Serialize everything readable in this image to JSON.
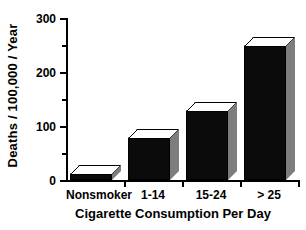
{
  "chart_data": {
    "type": "bar",
    "title": "",
    "subtitle": "",
    "xlabel": "Cigarette Consumption Per Day",
    "ylabel": "Deaths / 100,000 / Year",
    "categories": [
      "Nonsmoker",
      "1-14",
      "15-24",
      "> 25"
    ],
    "values": [
      12,
      78,
      128,
      248
    ],
    "ylim": [
      0,
      300
    ],
    "ytick_labels": [
      "0",
      "100",
      "200",
      "300"
    ],
    "ytick_values": [
      0,
      100,
      200,
      300
    ],
    "yminor_tick_values": [
      50,
      150,
      250
    ],
    "grid": false,
    "legend": false,
    "legend_position": "none",
    "style": "3d-bar",
    "colors": {
      "bar_front": "#0b0b0b",
      "bar_top": "#ffffff",
      "bar_side": "#7d7d7d",
      "axis": "#000000",
      "background": "#ffffff",
      "text": "#000000"
    }
  }
}
